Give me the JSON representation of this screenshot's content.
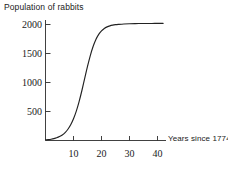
{
  "chart_data": {
    "type": "line",
    "title": "Population of rabbits",
    "xlabel": "Years since 1774",
    "ylabel": "Population of rabbits",
    "xlim": [
      0,
      44
    ],
    "ylim": [
      0,
      2150
    ],
    "grid": false,
    "legend": null,
    "xticks": [
      10,
      20,
      30,
      40
    ],
    "xtick_labels": [
      "10",
      "20",
      "30",
      "40"
    ],
    "yticks": [
      500,
      1000,
      1500,
      2000
    ],
    "ytick_labels": [
      "500",
      "1000",
      "1500",
      "2000"
    ],
    "curve_shape": "logistic",
    "carrying_capacity": 2030,
    "inflection_year": 14,
    "growth_rate": 0.38,
    "series": [
      {
        "name": "Rabbit population",
        "color": "#222222",
        "x": [
          0,
          1,
          2,
          3,
          4,
          5,
          6,
          7,
          8,
          9,
          10,
          11,
          12,
          13,
          14,
          15,
          16,
          17,
          18,
          19,
          20,
          21,
          22,
          23,
          24,
          25,
          26,
          28,
          30,
          32,
          34,
          36,
          38,
          40,
          42
        ],
        "y": [
          10,
          15,
          22,
          32,
          46,
          67,
          96,
          137,
          194,
          271,
          374,
          507,
          671,
          862,
          1070,
          1277,
          1465,
          1621,
          1742,
          1830,
          1891,
          1932,
          1959,
          1977,
          1989,
          1997,
          2002,
          2009,
          2013,
          2016,
          2017,
          2018,
          2018,
          2019,
          2019
        ]
      }
    ]
  },
  "axis_title_x": "Years since 1774",
  "plot_title": "Population of rabbits"
}
